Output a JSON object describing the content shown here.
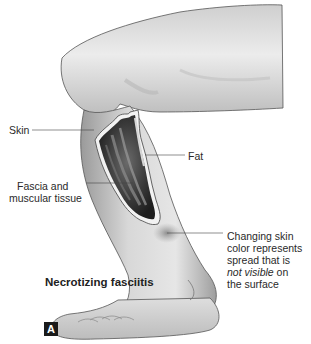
{
  "figure": {
    "title": "Necrotizing fasciitis",
    "panel_letter": "A",
    "labels": {
      "skin": "Skin",
      "fat": "Fat",
      "fascia_line1": "Fascia and",
      "fascia_line2": "muscular tissue",
      "changing_line1": "Changing skin",
      "changing_line2": "color represents",
      "changing_line3": "spread that is",
      "changing_line4_italic": "not visible",
      "changing_line4_rest": " on",
      "changing_line5": "the surface"
    },
    "colors": {
      "background": "#ffffff",
      "skin_tone": "#d9d9d9",
      "wound_dark": "#2b2b2b",
      "wound_edge": "#f2f2f2",
      "panel_box": "#1a1a1a"
    }
  }
}
